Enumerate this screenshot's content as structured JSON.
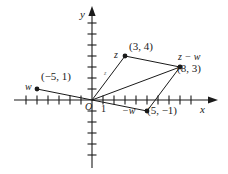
{
  "figure": {
    "type": "vector-diagram",
    "background_color": "#ffffff",
    "ink_color": "#1a1a1a"
  },
  "axes": {
    "x_label": "x",
    "y_label": "y",
    "origin_label": "O",
    "unit_label": "1",
    "origin_px": {
      "x": 92,
      "y": 100
    },
    "tick_spacing_px": 11,
    "x_ticks_negative": 7,
    "x_ticks_positive": 9,
    "y_ticks_up": 8,
    "y_ticks_down": 6,
    "x_range": [
      -7,
      9
    ],
    "y_range": [
      -6,
      8
    ],
    "grid": false
  },
  "points": [
    {
      "id": "z",
      "name": "z",
      "coord_text": "(3, 4)",
      "x": 3,
      "y": 4,
      "dot": true
    },
    {
      "id": "w",
      "name": "w",
      "coord_text": "(-5, 1)",
      "x": -5,
      "y": 1,
      "dot": true
    },
    {
      "id": "negw",
      "name": "-w",
      "coord_text": "(5, -1)",
      "x": 5,
      "y": -1,
      "dot": true
    },
    {
      "id": "zminusw",
      "name": "z - w",
      "coord_text": "(8, 3)",
      "x": 8,
      "y": 3,
      "dot": true
    }
  ],
  "labels": {
    "z_name": "z",
    "z_coord": "(3, 4)",
    "w_name": "w",
    "w_coord": "(−5, 1)",
    "negw_name": "−w",
    "negw_coord": "(5, −1)",
    "zmw_name": "z − w",
    "zmw_coord": "(8, 3)",
    "vector_z_tick": "z"
  },
  "segments": [
    {
      "from": "O",
      "to": "z",
      "style": "solid",
      "kind": "vector"
    },
    {
      "from": "O",
      "to": "w",
      "style": "solid",
      "kind": "vector"
    },
    {
      "from": "O",
      "to": "negw",
      "style": "solid",
      "kind": "vector"
    },
    {
      "from": "O",
      "to": "zminusw",
      "style": "solid",
      "kind": "vector"
    },
    {
      "from": "z",
      "to": "zminusw",
      "style": "solid",
      "kind": "side"
    },
    {
      "from": "negw",
      "to": "zminusw",
      "style": "solid",
      "kind": "side"
    }
  ]
}
